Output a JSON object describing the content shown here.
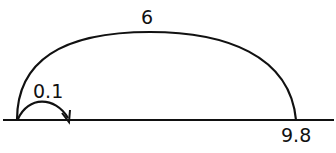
{
  "diagram": {
    "type": "number-line-jumps",
    "number_line": {
      "start_label": "",
      "end_label": "9.8"
    },
    "jumps": [
      {
        "label": "0.1",
        "size": "small"
      },
      {
        "label": "6",
        "size": "large"
      }
    ],
    "colors": {
      "stroke": "#111111",
      "background": "#ffffff"
    }
  }
}
